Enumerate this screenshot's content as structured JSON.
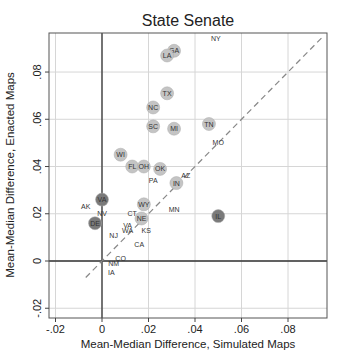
{
  "chart_data": {
    "type": "scatter",
    "title": "State Senate",
    "xlabel": "Mean-Median Difference, Simulated Maps",
    "ylabel": "Mean-Median Difference, Enacted Maps",
    "xlim": [
      -0.023,
      0.097
    ],
    "ylim": [
      -0.025,
      0.097
    ],
    "x_ticks": [
      -0.02,
      0,
      0.02,
      0.04,
      0.06,
      0.08
    ],
    "x_tick_labels": [
      "-.02",
      "0",
      ".02",
      ".04",
      ".06",
      ".08"
    ],
    "y_ticks": [
      -0.02,
      0,
      0.02,
      0.04,
      0.06,
      0.08
    ],
    "y_tick_labels": [
      "-.02",
      "0",
      ".02",
      ".04",
      ".06",
      ".08"
    ],
    "grid": true,
    "reference_lines": {
      "x0": true,
      "y0": true,
      "diagonal_dashed": [
        [
          -0.007,
          -0.007
        ],
        [
          0.095,
          0.095
        ]
      ]
    },
    "legend": null,
    "points": [
      {
        "label": "NY",
        "x": 0.049,
        "y": 0.094,
        "marker": "none"
      },
      {
        "label": "GA",
        "x": 0.031,
        "y": 0.089,
        "marker": "light"
      },
      {
        "label": "LA",
        "x": 0.028,
        "y": 0.087,
        "marker": "light"
      },
      {
        "label": "TX",
        "x": 0.028,
        "y": 0.071,
        "marker": "light"
      },
      {
        "label": "NC",
        "x": 0.022,
        "y": 0.065,
        "marker": "light"
      },
      {
        "label": "TN",
        "x": 0.046,
        "y": 0.058,
        "marker": "light"
      },
      {
        "label": "SC",
        "x": 0.022,
        "y": 0.057,
        "marker": "light"
      },
      {
        "label": "MI",
        "x": 0.031,
        "y": 0.056,
        "marker": "light"
      },
      {
        "label": "MO",
        "x": 0.05,
        "y": 0.05,
        "marker": "none"
      },
      {
        "label": "WI",
        "x": 0.008,
        "y": 0.045,
        "marker": "light"
      },
      {
        "label": "FL",
        "x": 0.013,
        "y": 0.04,
        "marker": "light"
      },
      {
        "label": "OH",
        "x": 0.018,
        "y": 0.04,
        "marker": "light"
      },
      {
        "label": "OK",
        "x": 0.025,
        "y": 0.039,
        "marker": "light"
      },
      {
        "label": "PA",
        "x": 0.022,
        "y": 0.034,
        "marker": "none"
      },
      {
        "label": "AZ",
        "x": 0.036,
        "y": 0.036,
        "marker": "none"
      },
      {
        "label": "IN",
        "x": 0.032,
        "y": 0.033,
        "marker": "light"
      },
      {
        "label": "VA",
        "x": 0.0,
        "y": 0.026,
        "marker": "dark"
      },
      {
        "label": "AK",
        "x": -0.007,
        "y": 0.023,
        "marker": "none"
      },
      {
        "label": "WY",
        "x": 0.018,
        "y": 0.024,
        "marker": "light"
      },
      {
        "label": "MN",
        "x": 0.031,
        "y": 0.022,
        "marker": "none"
      },
      {
        "label": "NV",
        "x": 0.0,
        "y": 0.02,
        "marker": "none"
      },
      {
        "label": "CT",
        "x": 0.013,
        "y": 0.02,
        "marker": "none"
      },
      {
        "label": "IL",
        "x": 0.05,
        "y": 0.019,
        "marker": "dark"
      },
      {
        "label": "NE",
        "x": 0.017,
        "y": 0.018,
        "marker": "light"
      },
      {
        "label": "DE",
        "x": -0.003,
        "y": 0.016,
        "marker": "dark"
      },
      {
        "label": "VA",
        "x": 0.011,
        "y": 0.015,
        "marker": "none"
      },
      {
        "label": "WA",
        "x": 0.011,
        "y": 0.013,
        "marker": "none"
      },
      {
        "label": "KS",
        "x": 0.019,
        "y": 0.013,
        "marker": "none"
      },
      {
        "label": "NJ",
        "x": 0.005,
        "y": 0.011,
        "marker": "none"
      },
      {
        "label": "CA",
        "x": 0.016,
        "y": 0.007,
        "marker": "none"
      },
      {
        "label": "CO",
        "x": 0.008,
        "y": 0.001,
        "marker": "none"
      },
      {
        "label": "NM",
        "x": 0.005,
        "y": -0.001,
        "marker": "none"
      },
      {
        "label": "IA",
        "x": 0.004,
        "y": -0.005,
        "marker": "none"
      }
    ]
  },
  "colors": {
    "marker_light": "#c4c4c4",
    "marker_dark": "#7a7a7a",
    "grid": "#d6d6d6",
    "axis": "#444444",
    "text": "#222222"
  }
}
